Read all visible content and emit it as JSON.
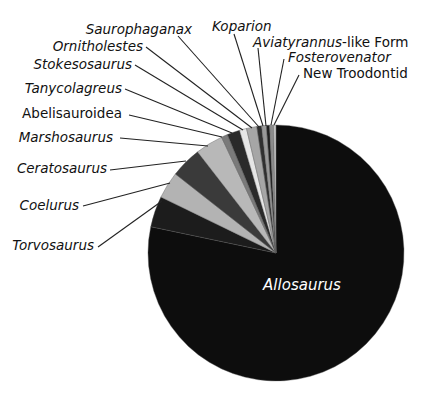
{
  "chart_data": {
    "type": "pie",
    "title": "",
    "start_angle_deg": 0,
    "direction": "clockwise",
    "slices": [
      {
        "label": "Allosaurus",
        "value": 78.3,
        "color": "#0d0d0d",
        "italic": true
      },
      {
        "label": "Torvosaurus",
        "value": 3.9,
        "color": "#1c1c1c",
        "italic": true
      },
      {
        "label": "Coelurus",
        "value": 3.4,
        "color": "#b3b3b3",
        "italic": true
      },
      {
        "label": "Ceratosaurus",
        "value": 3.9,
        "color": "#3a3a3a",
        "italic": true
      },
      {
        "label": "Marshosaurus",
        "value": 3.5,
        "color": "#b8b8b8",
        "italic": true
      },
      {
        "label": "Abelisauroidea",
        "value": 0.8,
        "color": "#7a7a7a",
        "italic": false
      },
      {
        "label": "Tanycolagreus",
        "value": 1.6,
        "color": "#2a2a2a",
        "italic": true
      },
      {
        "label": "Stokesosaurus",
        "value": 0.9,
        "color": "#e6e6e6",
        "italic": true
      },
      {
        "label": "Ornitholestes",
        "value": 1.3,
        "color": "#a6a6a6",
        "italic": true
      },
      {
        "label": "Saurophaganax",
        "value": 0.6,
        "color": "#303030",
        "italic": true
      },
      {
        "label": "Koparion",
        "value": 0.6,
        "color": "#999999",
        "italic": true
      },
      {
        "label": "Aviatyrannus-like Form",
        "value": 0.4,
        "color": "#1f1f1f",
        "italic": "partial"
      },
      {
        "label": "Fosterovenator",
        "value": 0.5,
        "color": "#8c8c8c",
        "italic": true
      },
      {
        "label": "New Troodontid",
        "value": 0.3,
        "color": "#c8c8c8",
        "italic": false
      }
    ]
  },
  "labels": {
    "allosaurus": "Allosaurus",
    "torvosaurus": "Torvosaurus",
    "coelurus": "Coelurus",
    "ceratosaurus": "Ceratosaurus",
    "marshosaurus": "Marshosaurus",
    "abelisauroidea": "Abelisauroidea",
    "tanycolagreus": "Tanycolagreus",
    "stokesosaurus": "Stokesosaurus",
    "ornitholestes": "Ornitholestes",
    "saurophaganax": "Saurophaganax",
    "koparion": "Koparion",
    "aviatyrannus_italic": "Aviatyrannus",
    "aviatyrannus_rest": "-like Form",
    "fosterovenator": "Fosterovenator",
    "new_troodontid": "New Troodontid"
  }
}
